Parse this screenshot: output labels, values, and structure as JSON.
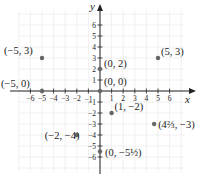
{
  "chart_data": {
    "type": "scatter",
    "title": "",
    "xlabel": "x",
    "ylabel": "y",
    "xlim": [
      -7,
      7
    ],
    "ylim": [
      -7,
      7
    ],
    "grid": true,
    "x_ticks": [
      -6,
      -5,
      -4,
      -3,
      -2,
      -1,
      1,
      2,
      3,
      4,
      5,
      6
    ],
    "y_ticks": [
      -6,
      -5,
      -4,
      -3,
      -2,
      -1,
      1,
      2,
      3,
      4,
      5,
      6
    ],
    "x_tick_labels": [
      "−6",
      "−5",
      "−4",
      "−3",
      "−2",
      "−1",
      "1",
      "2",
      "3",
      "4",
      "5",
      "6"
    ],
    "y_tick_labels": [
      "−6",
      "−5",
      "−4",
      "−3",
      "−2",
      "−1",
      "1",
      "2",
      "3",
      "4",
      "5",
      "6"
    ],
    "points": [
      {
        "x": -5,
        "y": 3,
        "label": "(−5, 3)"
      },
      {
        "x": 5,
        "y": 3,
        "label": "(5, 3)"
      },
      {
        "x": 0,
        "y": 2,
        "label": "(0, 2)"
      },
      {
        "x": 0,
        "y": 0,
        "label": "(0, 0)"
      },
      {
        "x": -5,
        "y": 0,
        "label": "(−5, 0)"
      },
      {
        "x": 1,
        "y": -2,
        "label": "(1, −2)"
      },
      {
        "x": 4.6667,
        "y": -3,
        "label": "(4⅔, −3)"
      },
      {
        "x": -2,
        "y": -4,
        "label": "(−2, −4)"
      },
      {
        "x": 0,
        "y": -5.5,
        "label": "(0, −5½)"
      }
    ]
  },
  "axes": {
    "x_label": "x",
    "y_label": "y"
  },
  "colors": {
    "axis": "#222222",
    "grid": "#ececec",
    "point": "#666666",
    "text": "#222222"
  }
}
